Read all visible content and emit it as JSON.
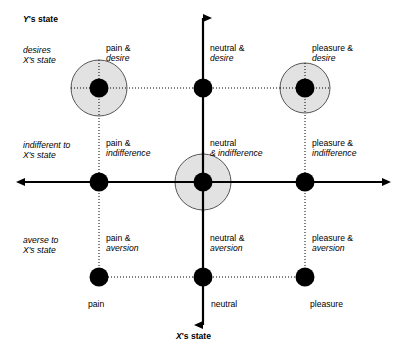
{
  "figure": {
    "axes": {
      "y_title_prefix": "Y",
      "y_title_suffix": "'s state",
      "x_title_prefix": "X",
      "x_title_suffix": "'s state"
    },
    "row_labels": [
      {
        "name": "desires",
        "line1": "desires",
        "line2": "X's state"
      },
      {
        "name": "indifferent",
        "line1": "indifferent to",
        "line2": "X's state"
      },
      {
        "name": "averse",
        "line1": "averse to",
        "line2": "X's state"
      }
    ],
    "column_tick_labels": [
      "pain",
      "neutral",
      "pleasure"
    ],
    "cells": [
      {
        "id": "pain-desire",
        "line1": "pain &",
        "line2": "desire",
        "highlighted": true
      },
      {
        "id": "neutral-desire",
        "line1": "neutral &",
        "line2": "desire",
        "highlighted": false
      },
      {
        "id": "pleasure-desire",
        "line1": "pleasure &",
        "line2": "desire",
        "highlighted": true
      },
      {
        "id": "pain-indifference",
        "line1": "pain &",
        "line2": "indifference",
        "highlighted": false
      },
      {
        "id": "neutral-indifference",
        "line1": "neutral",
        "line2": "& indifference",
        "highlighted": true
      },
      {
        "id": "pleasure-indifference",
        "line1": "pleasure &",
        "line2": "indifference",
        "highlighted": false
      },
      {
        "id": "pain-aversion",
        "line1": "pain &",
        "line2": "aversion",
        "highlighted": false
      },
      {
        "id": "neutral-aversion",
        "line1": "neutral &",
        "line2": "aversion",
        "highlighted": false
      },
      {
        "id": "pleasure-aversion",
        "line1": "pleasure &",
        "line2": "aversion",
        "highlighted": false
      }
    ],
    "colors": {
      "line": "#000000",
      "node_fill": "#000000",
      "halo_fill": "#e2e2e2",
      "halo_stroke": "#555555",
      "background": "#ffffff"
    }
  }
}
